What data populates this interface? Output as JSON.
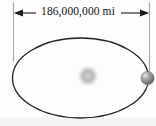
{
  "figure": {
    "name": "orbit-diameter-diagram",
    "caption_text": "186,000,000 mi",
    "background_color": "#fdfdfd"
  },
  "dimension": {
    "label": "186,000,000 mi",
    "value": 186000000,
    "unit": "mi",
    "arrow_left_name": "left-arrowhead",
    "arrow_right_name": "right-arrowhead",
    "line_color": "#1a1a1a",
    "extension_line_color": "#a9a9a9"
  },
  "orbit": {
    "shape": "ellipse",
    "center_x": 80.5,
    "center_y": 78,
    "radius_x": 68,
    "radius_y": 40,
    "stroke_color": "#262626",
    "stroke_width": 1.3
  },
  "sun": {
    "label": "sun",
    "center_x": 88,
    "center_y": 76,
    "radius": 9,
    "core_color": "#f0f0f0",
    "ring_color": "#8f8f8f",
    "glow_color": "#d8d8d8"
  },
  "planet": {
    "label": "planet",
    "center_x": 147.5,
    "center_y": 78,
    "radius": 6.5,
    "fill_color": "#949494",
    "highlight_color": "#d6d6d6",
    "shadow_color": "#5a5a5a"
  }
}
